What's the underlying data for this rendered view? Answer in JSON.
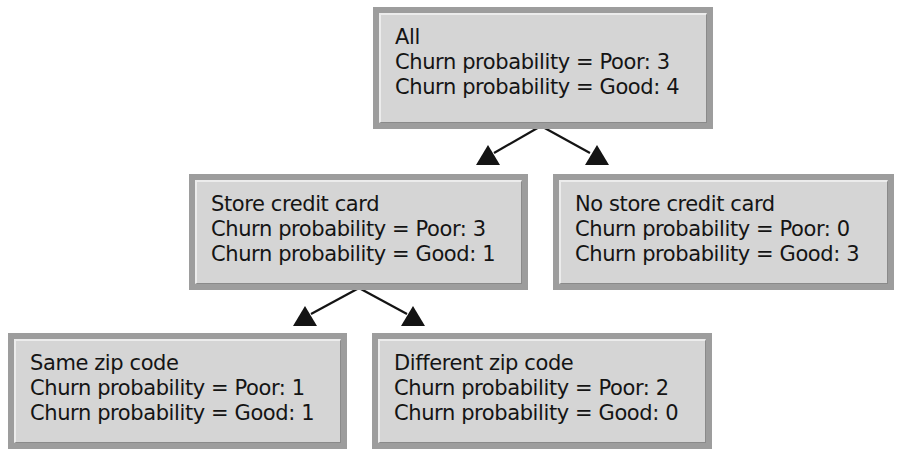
{
  "diagram": {
    "type": "decision-tree",
    "colors": {
      "box_border": "#9d9d9d",
      "box_fill": "#d5d5d5",
      "text": "#141414",
      "edge": "#141414"
    },
    "nodes": [
      {
        "id": "all",
        "title": "All",
        "poor_line": "Churn probability = Poor: 3",
        "good_line": "Churn probability = Good: 4"
      },
      {
        "id": "store-credit-card",
        "title": "Store credit card",
        "poor_line": "Churn probability = Poor: 3",
        "good_line": "Churn probability = Good: 1"
      },
      {
        "id": "no-store-credit-card",
        "title": "No store credit card",
        "poor_line": "Churn probability = Poor: 0",
        "good_line": "Churn probability = Good: 3"
      },
      {
        "id": "same-zip-code",
        "title": "Same zip code",
        "poor_line": "Churn probability = Poor: 1",
        "good_line": "Churn probability = Good: 1"
      },
      {
        "id": "different-zip-code",
        "title": "Different zip code",
        "poor_line": "Churn probability = Poor: 2",
        "good_line": "Churn probability = Good: 0"
      }
    ],
    "edges": [
      {
        "from": "all",
        "to": "store-credit-card"
      },
      {
        "from": "all",
        "to": "no-store-credit-card"
      },
      {
        "from": "store-credit-card",
        "to": "same-zip-code"
      },
      {
        "from": "store-credit-card",
        "to": "different-zip-code"
      }
    ]
  }
}
